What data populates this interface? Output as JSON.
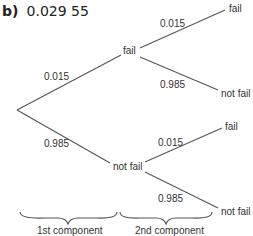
{
  "heading": {
    "part": "b)",
    "answer": "0.029 55"
  },
  "tree": {
    "level1": [
      {
        "node": "fail",
        "prob": "0.015",
        "children": [
          {
            "node": "fail",
            "prob": "0.015"
          },
          {
            "node": "not fail",
            "prob": "0.985"
          }
        ]
      },
      {
        "node": "not fail",
        "prob": "0.985",
        "children": [
          {
            "node": "fail",
            "prob": "0.015"
          },
          {
            "node": "not fail",
            "prob": "0.985"
          }
        ]
      }
    ]
  },
  "components": [
    "1st component",
    "2nd component"
  ],
  "colors": {
    "line": "#555555",
    "text": "#333333"
  }
}
